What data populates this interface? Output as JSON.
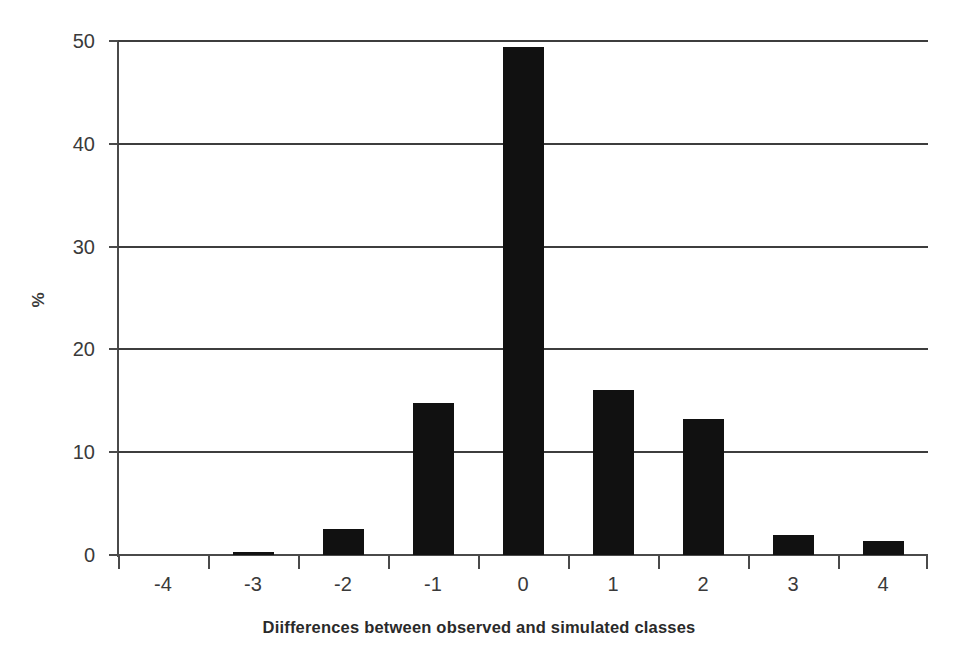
{
  "chart_data": {
    "type": "bar",
    "title": "",
    "subtitle": "",
    "xlabel": "Diifferences between observed and simulated classes",
    "ylabel": "%",
    "categories": [
      "-4",
      "-3",
      "-2",
      "-1",
      "0",
      "1",
      "2",
      "3",
      "4"
    ],
    "values": [
      0,
      0.3,
      2.5,
      14.8,
      49.4,
      16.1,
      13.2,
      1.9,
      1.4
    ],
    "ylim": [
      0,
      50
    ],
    "yticks": [
      0,
      10,
      20,
      30,
      40,
      50
    ],
    "ytick_labels": [
      "0",
      "10",
      "20",
      "30",
      "40",
      "50"
    ],
    "grid": "horizontal",
    "legend": "none",
    "series": [
      {
        "name": "Differences",
        "color": "#111111",
        "values": [
          0,
          0.3,
          2.5,
          14.8,
          49.4,
          16.1,
          13.2,
          1.9,
          1.4
        ]
      }
    ],
    "colors": {
      "bar": "#111111",
      "axis": "#4a4a4a",
      "grid": "#3d3d3d",
      "text": "#3a3a3a",
      "background": "#ffffff"
    }
  }
}
